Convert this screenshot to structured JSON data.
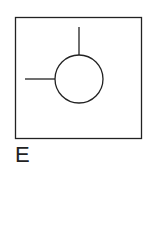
{
  "figure": {
    "label": "E",
    "frame": {
      "x": 15.5,
      "y": 17.5,
      "width": 126,
      "height": 121
    },
    "circle": {
      "cx": 79,
      "cy": 79,
      "r": 24
    },
    "vertical_line": {
      "x1": 79,
      "y1": 27,
      "x2": 79,
      "y2": 55
    },
    "horizontal_line": {
      "x1": 25,
      "y1": 79,
      "x2": 55,
      "y2": 79
    },
    "stroke_color": "#222222"
  }
}
